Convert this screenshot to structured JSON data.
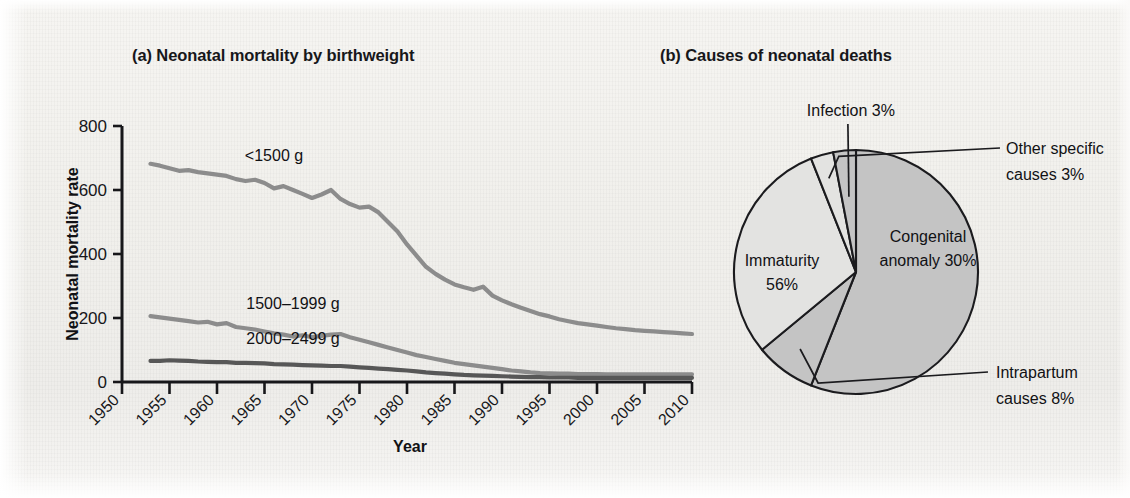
{
  "figure": {
    "background_color": "#f2f1ee",
    "ink_color": "#17171a"
  },
  "panel_a": {
    "title": "(a) Neonatal mortality by birthweight"
  },
  "panel_b": {
    "title": "(b) Causes of neonatal deaths"
  },
  "chart_data": [
    {
      "type": "line",
      "title": "(a) Neonatal mortality by birthweight",
      "xlabel": "Year",
      "ylabel": "Neonatal mortality rate",
      "xlim": [
        1950,
        2010
      ],
      "ylim": [
        0,
        800
      ],
      "xticks": [
        1950,
        1955,
        1960,
        1965,
        1970,
        1975,
        1980,
        1985,
        1990,
        1995,
        2000,
        2005,
        2010
      ],
      "xtick_labels": [
        "1950",
        "1955",
        "1960",
        "1965",
        "1970",
        "1975",
        "1980",
        "1985",
        "1990",
        "1995",
        "2000",
        "2005",
        "2010"
      ],
      "yticks": [
        0,
        200,
        400,
        600,
        800
      ],
      "ytick_labels": [
        "0",
        "200",
        "400",
        "600",
        "800"
      ],
      "grid": false,
      "legend_position": "inline-annotation",
      "x": [
        1953,
        1954,
        1955,
        1956,
        1957,
        1958,
        1959,
        1960,
        1961,
        1962,
        1963,
        1964,
        1965,
        1966,
        1967,
        1968,
        1969,
        1970,
        1971,
        1972,
        1973,
        1974,
        1975,
        1976,
        1977,
        1978,
        1979,
        1980,
        1981,
        1982,
        1983,
        1984,
        1985,
        1986,
        1987,
        1988,
        1989,
        1990,
        1991,
        1992,
        1993,
        1994,
        1995,
        1996,
        1997,
        1998,
        1999,
        2000,
        2001,
        2002,
        2003,
        2004,
        2005,
        2006,
        2007,
        2008,
        2009,
        2010
      ],
      "series": [
        {
          "name": "<1500 g",
          "color": "#8c8c8c",
          "label_x": 1966,
          "label_y": 690,
          "values": [
            682,
            676,
            668,
            660,
            662,
            656,
            652,
            648,
            644,
            634,
            628,
            632,
            622,
            605,
            612,
            600,
            588,
            575,
            586,
            600,
            572,
            556,
            545,
            548,
            530,
            500,
            470,
            430,
            395,
            360,
            338,
            320,
            305,
            296,
            288,
            298,
            270,
            255,
            243,
            232,
            222,
            212,
            205,
            196,
            190,
            184,
            180,
            176,
            172,
            168,
            165,
            162,
            160,
            158,
            156,
            154,
            152,
            150
          ]
        },
        {
          "name": "1500–1999 g",
          "color": "#8c8c8c",
          "label_x": 1968,
          "label_y": 228,
          "values": [
            206,
            202,
            198,
            194,
            190,
            186,
            188,
            180,
            184,
            172,
            168,
            164,
            158,
            152,
            148,
            142,
            146,
            140,
            144,
            148,
            150,
            140,
            132,
            124,
            116,
            108,
            100,
            92,
            84,
            78,
            72,
            66,
            60,
            56,
            52,
            48,
            44,
            40,
            36,
            33,
            30,
            28,
            27,
            26,
            26,
            25,
            25,
            25,
            24,
            24,
            24,
            24,
            24,
            24,
            24,
            24,
            24,
            24
          ]
        },
        {
          "name": "2000–2499 g",
          "color": "#575757",
          "label_x": 1968,
          "label_y": 120,
          "values": [
            66,
            66,
            68,
            67,
            66,
            64,
            63,
            62,
            62,
            60,
            60,
            59,
            58,
            56,
            55,
            54,
            53,
            52,
            51,
            50,
            50,
            48,
            46,
            44,
            42,
            40,
            38,
            36,
            33,
            30,
            28,
            26,
            24,
            22,
            21,
            20,
            19,
            18,
            17,
            16,
            15,
            15,
            14,
            14,
            14,
            13,
            13,
            13,
            13,
            13,
            13,
            13,
            13,
            13,
            13,
            13,
            13,
            13
          ]
        }
      ]
    },
    {
      "type": "pie",
      "title": "(b) Causes of neonatal deaths",
      "grid": false,
      "legend_position": "leader-labels",
      "slices": [
        {
          "label": "Immaturity",
          "value_label": "56%",
          "value": 56,
          "color": "#c4c4c4",
          "label_line_1": "Immaturity",
          "label_line_2": "56%",
          "placement": "inside"
        },
        {
          "label": "Intrapartum causes",
          "value_label": "8%",
          "value": 8,
          "color": "#c4c4c4",
          "label_line_1": "Intrapartum",
          "label_line_2": "causes 8%",
          "placement": "leader-right-lower"
        },
        {
          "label": "Congenital anomaly",
          "value_label": "30%",
          "value": 30,
          "color": "#e3e3e1",
          "label_line_1": "Congenital",
          "label_line_2": "anomaly 30%",
          "placement": "inside"
        },
        {
          "label": "Other specific causes",
          "value_label": "3%",
          "value": 3,
          "color": "#e3e3e1",
          "label_line_1": "Other specific",
          "label_line_2": "causes 3%",
          "placement": "leader-right-upper"
        },
        {
          "label": "Infection",
          "value_label": "3%",
          "value": 3,
          "color": "#c4c4c4",
          "label_line_1": "Infection 3%",
          "label_line_2": "",
          "placement": "leader-top"
        }
      ]
    }
  ]
}
